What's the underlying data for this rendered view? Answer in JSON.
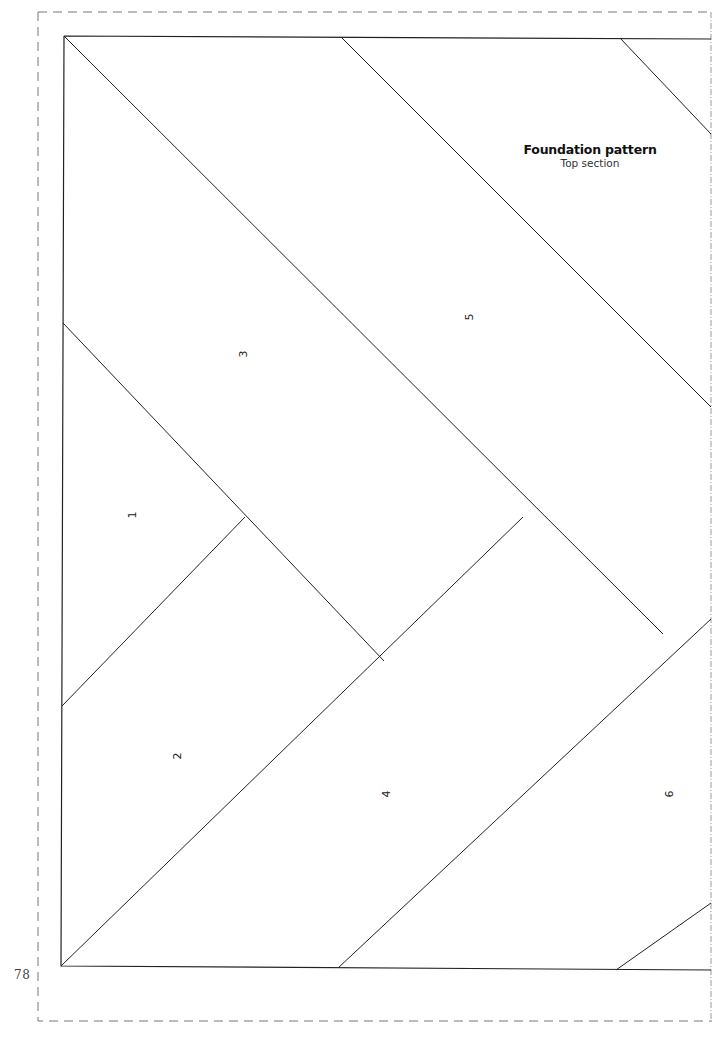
{
  "document": {
    "title": "Foundation pattern",
    "subtitle": "Top section",
    "page_number": "78"
  },
  "pieces": [
    {
      "label": "1",
      "x": 128,
      "y": 510
    },
    {
      "label": "2",
      "x": 172,
      "y": 750
    },
    {
      "label": "3",
      "x": 238,
      "y": 349
    },
    {
      "label": "4",
      "x": 381,
      "y": 789
    },
    {
      "label": "5",
      "x": 464,
      "y": 312
    },
    {
      "label": "6",
      "x": 664,
      "y": 789
    }
  ],
  "colors": {
    "line": "#222222",
    "dashed_border": "#666666",
    "background": "#ffffff"
  }
}
